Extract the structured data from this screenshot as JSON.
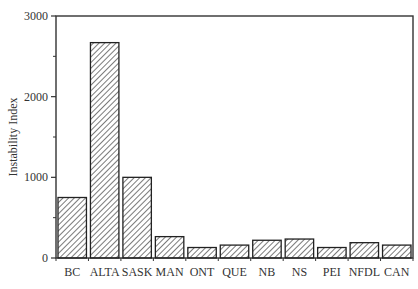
{
  "chart_data": {
    "type": "bar",
    "title": "",
    "xlabel": "",
    "ylabel": "Instability Index",
    "ylim": [
      0,
      3000
    ],
    "yticks": [
      0,
      1000,
      2000,
      3000
    ],
    "grid": false,
    "legend": null,
    "bar_fill": "diagonal-hatch",
    "categories": [
      "BC",
      "ALTA",
      "SASK",
      "MAN",
      "ONT",
      "QUE",
      "NB",
      "NS",
      "PEI",
      "NFDL",
      "CAN"
    ],
    "values": [
      750,
      2670,
      1000,
      265,
      130,
      160,
      220,
      235,
      130,
      190,
      160
    ]
  }
}
